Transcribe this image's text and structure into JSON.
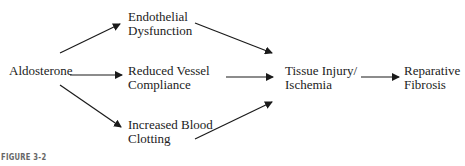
{
  "nodes": {
    "aldosterone": "Aldosterone",
    "endothelial_l1": "Endothelial",
    "endothelial_l2": "Dysfunction",
    "compliance_l1": "Reduced Vessel",
    "compliance_l2": "Compliance",
    "clotting_l1": "Increased Blood",
    "clotting_l2": "Clotting",
    "injury_l1": "Tissue Injury/",
    "injury_l2": "Ischemia",
    "fibrosis_l1": "Reparative",
    "fibrosis_l2": "Fibrosis"
  },
  "caption": "FIGURE 3-2",
  "colors": {
    "line": "#1a1a1a",
    "text": "#222222",
    "caption": "#666666"
  }
}
